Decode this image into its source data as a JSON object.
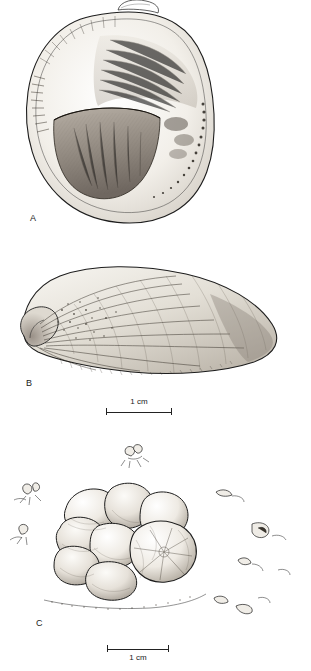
{
  "figure": {
    "panels": [
      {
        "label": "A",
        "caption": "",
        "name": "panel-a"
      },
      {
        "label": "B",
        "caption": "",
        "name": "panel-b"
      },
      {
        "label": "C",
        "caption": "",
        "name": "panel-c"
      }
    ],
    "scale_bars": [
      {
        "label": "1 cm",
        "for_panel": "B"
      },
      {
        "label": "1 cm",
        "for_panel": "C"
      }
    ]
  }
}
